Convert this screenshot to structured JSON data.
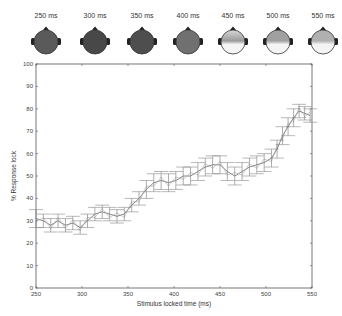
{
  "topomaps": [
    {
      "label": "250 ms",
      "shade": "#5a5a5a",
      "light_front": false,
      "light_back": false
    },
    {
      "label": "300 ms",
      "shade": "#484848",
      "light_front": false,
      "light_back": false
    },
    {
      "label": "350 ms",
      "shade": "#4e4e4e",
      "light_front": false,
      "light_back": false
    },
    {
      "label": "400 ms",
      "shade": "#707070",
      "light_front": false,
      "light_back": false
    },
    {
      "label": "450 ms",
      "shade": "#9a9a9a",
      "light_front": true,
      "light_back": true
    },
    {
      "label": "500 ms",
      "shade": "#a0a0a0",
      "light_front": false,
      "light_back": true
    },
    {
      "label": "550 ms",
      "shade": "#b0b0b0",
      "light_front": false,
      "light_back": true
    }
  ],
  "chart_data": {
    "type": "line",
    "title": "",
    "xlabel": "Stimulus locked time (ms)",
    "ylabel": "% Response lock",
    "xlim": [
      250,
      550
    ],
    "ylim": [
      0,
      100
    ],
    "xticks": [
      250,
      300,
      350,
      400,
      450,
      500,
      550
    ],
    "yticks": [
      0,
      10,
      20,
      30,
      40,
      50,
      60,
      70,
      80,
      90,
      100
    ],
    "grid": false,
    "series": [
      {
        "name": "response lock (with error bars)",
        "x": [
          250,
          258,
          266,
          274,
          282,
          290,
          298,
          306,
          314,
          322,
          330,
          338,
          346,
          354,
          362,
          370,
          378,
          386,
          394,
          402,
          410,
          418,
          426,
          434,
          442,
          450,
          458,
          466,
          474,
          482,
          490,
          498,
          506,
          512,
          518,
          524,
          530,
          536,
          542,
          548
        ],
        "values": [
          31,
          30,
          28,
          30,
          28,
          29,
          27,
          30,
          33,
          34,
          33,
          32,
          33,
          37,
          40,
          44,
          47,
          48,
          47,
          48,
          50,
          50,
          52,
          54,
          55,
          55,
          52,
          50,
          52,
          54,
          55,
          56,
          58,
          62,
          68,
          72,
          76,
          79,
          78,
          77
        ],
        "errors": [
          4,
          3,
          3,
          3,
          3,
          3,
          3,
          3,
          3,
          3,
          3,
          3,
          3,
          3,
          3,
          4,
          4,
          4,
          4,
          4,
          4,
          4,
          4,
          4,
          4,
          4,
          4,
          4,
          4,
          4,
          4,
          4,
          4,
          4,
          4,
          4,
          4,
          3,
          3,
          3
        ]
      }
    ]
  }
}
